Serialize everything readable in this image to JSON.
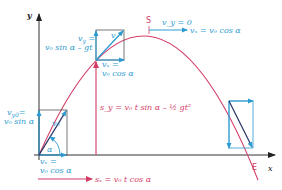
{
  "colors": {
    "trajectory": "#d43c66",
    "velocity": "#2e9bd0",
    "axes": "#333333",
    "vector_box": "#555555"
  },
  "axes": {
    "x_label": "x",
    "y_label": "y"
  },
  "points": {
    "apex": "S",
    "end": "E"
  },
  "angle_label": "α",
  "labels": {
    "v0_start": "v₀",
    "vy0_line1": "v",
    "vy0_sub": "y0",
    "vy0_eq": "=",
    "vy0_line2": "v₀ sin α",
    "vx_start_line1": "vₓ =",
    "vx_start_line2": "v₀ cos α",
    "vy_mid_line1": "v",
    "vy_mid_sub": "y",
    "vy_mid_eq": " =",
    "vy_mid_line2": "v₀ sin α – gt",
    "v_mid": "v",
    "vx_mid_line1": "vₓ =",
    "vx_mid_line2": "v₀ cos α",
    "vy_apex": "v_y = 0",
    "vx_apex": "vₓ = v₀ cos α",
    "sy_formula": "s_y = v₀ t sin α – ½ gt²",
    "sx_formula": "sₓ = v₀ t cos α"
  }
}
